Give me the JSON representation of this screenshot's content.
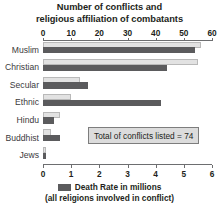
{
  "chart_data": {
    "type": "bar",
    "orientation": "horizontal",
    "title": "Number of conflicts and religious affiliation of combatants",
    "title_lines": [
      "Number of conflicts and",
      "religious affiliation of combatants"
    ],
    "categories": [
      "Muslim",
      "Christian",
      "Secular",
      "Ethnic",
      "Hindu",
      "Buddhist",
      "Jews"
    ],
    "series": [
      {
        "name": "Number of conflicts",
        "axis": "top",
        "color": "#e2e2e2",
        "values": [
          56,
          55,
          13,
          10,
          6,
          3,
          1
        ]
      },
      {
        "name": "Death Rate in millions",
        "axis": "bottom",
        "color": "#5b5b5d",
        "values": [
          5.4,
          4.4,
          1.6,
          4.2,
          0.4,
          0.6,
          0.1
        ]
      }
    ],
    "axis_top": {
      "label": "",
      "min": 0,
      "max": 60,
      "step": 10,
      "ticks": [
        "0",
        "10",
        "20",
        "30",
        "40",
        "50",
        "60"
      ]
    },
    "axis_bottom": {
      "label": "",
      "min": 0,
      "max": 6,
      "step": 1,
      "ticks": [
        "0",
        "1",
        "2",
        "3",
        "4",
        "5",
        "6"
      ]
    },
    "grid": false,
    "legend": {
      "position": "bottom",
      "line1": "Death Rate in millions",
      "line2": "(all religions involved in conflict)"
    },
    "annotations": [
      {
        "text": "Total of conflicts listed = 74"
      }
    ]
  },
  "callout": {
    "text": "Total of conflicts listed = 74"
  },
  "colors": {
    "conflicts": "#e2e2e2",
    "deaths": "#5b5b5d",
    "axis": "#6d6e70",
    "text": "#231f20"
  }
}
